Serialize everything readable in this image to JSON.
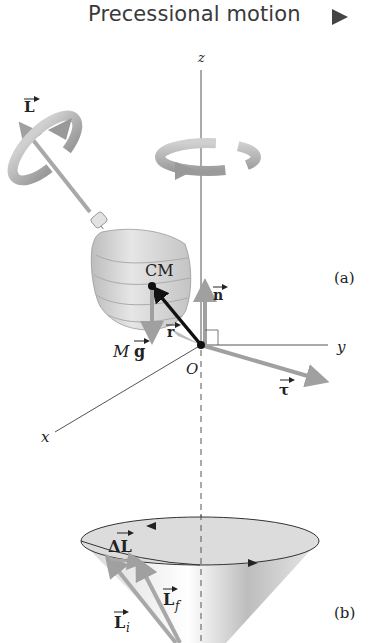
{
  "header": {
    "title": "Precessional motion",
    "play_button_icon": "play-triangle-icon"
  },
  "diagram": {
    "panel_a_label": "(a)",
    "panel_b_label": "(b)",
    "axes": {
      "z": "z",
      "y": "y",
      "x": "x",
      "origin": "O"
    },
    "labels": {
      "angular_momentum": "L",
      "center_of_mass": "CM",
      "normal_force": "n",
      "position_vector": "r",
      "weight_M": "M",
      "weight_g": "g",
      "torque": "τ",
      "delta_L": "ΔL",
      "delta_L_delta": "Δ",
      "delta_L_L": "L",
      "L_final": "L",
      "L_final_sub": "f",
      "L_initial": "L",
      "L_initial_sub": "i"
    },
    "colors": {
      "vector_gray": "#a0a0a0",
      "top_body": "#cfcfcf",
      "axis": "#555555",
      "r_vector": "#111111"
    }
  }
}
